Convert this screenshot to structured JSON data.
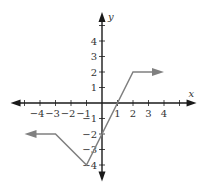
{
  "chart_data": {
    "type": "line",
    "title": "",
    "xlabel": "x",
    "ylabel": "y",
    "xlim": [
      -5.9,
      6.1
    ],
    "ylim": [
      -5,
      6.0
    ],
    "x_ticks": [
      -4,
      -3,
      -2,
      -1,
      1,
      2,
      3,
      4
    ],
    "y_ticks": [
      -4,
      -3,
      -2,
      -1,
      1,
      2,
      3,
      4
    ],
    "x_tick_labels": [
      "-4",
      "-3",
      "-2",
      "-1",
      "1",
      "2",
      "3",
      "4"
    ],
    "y_tick_labels": [
      "-4",
      "-3",
      "-2",
      "-1",
      "1",
      "2",
      "3",
      "4"
    ],
    "grid": false,
    "series": [
      {
        "name": "piecewise function",
        "color": "#808080",
        "points": [
          [
            -5.0,
            -2
          ],
          [
            -3,
            -2
          ],
          [
            -1,
            -4
          ],
          [
            2,
            2
          ],
          [
            4.0,
            2
          ]
        ],
        "left_arrow": true,
        "right_arrow": true
      }
    ]
  },
  "colors": {
    "axis": "#1a1a1a",
    "graph": "#808080"
  }
}
